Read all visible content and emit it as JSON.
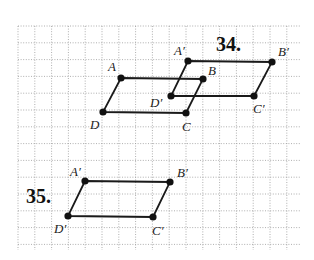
{
  "grid": {
    "x_start": 18,
    "x_end": 300,
    "y_start": 26,
    "y_end": 250,
    "spacing": 16.8,
    "line_color": "#9a9a9a"
  },
  "figures": [
    {
      "number": "34.",
      "number_pos": [
        216,
        51
      ],
      "parallelograms": [
        {
          "name": "original",
          "vertices": [
            {
              "label": "A",
              "x": 121,
              "y": 78,
              "lx": 108,
              "ly": 71
            },
            {
              "label": "B",
              "x": 203,
              "y": 79,
              "lx": 208,
              "ly": 75
            },
            {
              "label": "C",
              "x": 186,
              "y": 113,
              "lx": 182,
              "ly": 131
            },
            {
              "label": "D",
              "x": 103,
              "y": 112,
              "lx": 90,
              "ly": 129
            }
          ]
        },
        {
          "name": "image",
          "vertices": [
            {
              "label": "A′",
              "x": 188,
              "y": 61,
              "lx": 174,
              "ly": 55
            },
            {
              "label": "B′",
              "x": 272,
              "y": 62,
              "lx": 278,
              "ly": 56
            },
            {
              "label": "C′",
              "x": 254,
              "y": 96,
              "lx": 253,
              "ly": 113
            },
            {
              "label": "D′",
              "x": 171,
              "y": 96,
              "lx": 150,
              "ly": 107
            }
          ]
        }
      ]
    },
    {
      "number": "35.",
      "number_pos": [
        26,
        203
      ],
      "parallelograms": [
        {
          "name": "image",
          "vertices": [
            {
              "label": "A′",
              "x": 85,
              "y": 181,
              "lx": 70,
              "ly": 176
            },
            {
              "label": "B′",
              "x": 170,
              "y": 182,
              "lx": 177,
              "ly": 177
            },
            {
              "label": "C′",
              "x": 153,
              "y": 217,
              "lx": 152,
              "ly": 235
            },
            {
              "label": "D′",
              "x": 68,
              "y": 216,
              "lx": 54,
              "ly": 233
            }
          ]
        }
      ]
    }
  ],
  "colors": {
    "edge": "#1a1a1a",
    "vertex": "#111111",
    "label": "#222222"
  }
}
